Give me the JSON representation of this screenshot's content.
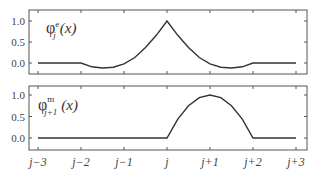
{
  "chart_data": [
    {
      "type": "line",
      "title": "",
      "label": "φ_j^e (x)",
      "label_parts": {
        "base": "φ",
        "sup": "e",
        "sub": "j",
        "arg": "(x)"
      },
      "xlabel": "",
      "ylabel": "",
      "x_ticks": [
        "j−3",
        "j−2",
        "j−1",
        "j",
        "j+1",
        "j+2",
        "j+3"
      ],
      "x_tick_values": [
        -3,
        -2,
        -1,
        0,
        1,
        2,
        3
      ],
      "y_ticks": [
        "0.0",
        "0.5",
        "1.0"
      ],
      "y_tick_values": [
        0.0,
        0.5,
        1.0
      ],
      "ylim": [
        -0.25,
        1.25
      ],
      "xlim": [
        -3.2,
        3.25
      ],
      "grid": false,
      "x": [
        -3,
        -2.5,
        -2,
        -1.75,
        -1.5,
        -1.25,
        -1,
        -0.75,
        -0.5,
        -0.25,
        0,
        0.25,
        0.5,
        0.75,
        1,
        1.25,
        1.5,
        1.75,
        2,
        2.5,
        3
      ],
      "values": [
        0,
        0,
        0,
        -0.09,
        -0.12,
        -0.1,
        -0.02,
        0.13,
        0.37,
        0.66,
        1.0,
        0.66,
        0.37,
        0.13,
        -0.02,
        -0.1,
        -0.12,
        -0.09,
        0,
        0,
        0
      ]
    },
    {
      "type": "line",
      "title": "",
      "label": "φ_{j+1}^m (x)",
      "label_parts": {
        "base": "φ",
        "sup": "m",
        "sub": "j+1",
        "arg": "(x)"
      },
      "xlabel": "",
      "ylabel": "",
      "x_ticks": [
        "j−3",
        "j−2",
        "j−1",
        "j",
        "j+1",
        "j+2",
        "j+3"
      ],
      "x_tick_values": [
        -3,
        -2,
        -1,
        0,
        1,
        2,
        3
      ],
      "y_ticks": [
        "0.0",
        "0.5",
        "1.0"
      ],
      "y_tick_values": [
        0.0,
        0.5,
        1.0
      ],
      "ylim": [
        -0.25,
        1.25
      ],
      "xlim": [
        -3.2,
        3.25
      ],
      "grid": false,
      "x": [
        -3,
        -2,
        -1,
        0,
        0.25,
        0.5,
        0.75,
        1,
        1.25,
        1.5,
        1.75,
        2,
        2.5,
        3
      ],
      "values": [
        0,
        0,
        0,
        0,
        0.44,
        0.75,
        0.94,
        1.0,
        0.94,
        0.75,
        0.44,
        0,
        0,
        0
      ]
    }
  ],
  "colors": {
    "line": "#333333",
    "frame": "#555555",
    "text": "#444444"
  }
}
